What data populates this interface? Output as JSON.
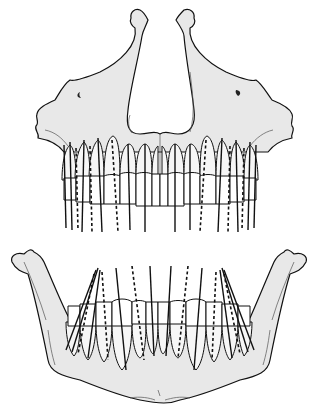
{
  "figure": {
    "type": "anatomical line drawing",
    "panels": [
      {
        "id": "maxilla",
        "label": "Upper jaw (maxilla) with upper dentition",
        "tooth_count": 16
      },
      {
        "id": "mandible",
        "label": "Lower jaw (mandible) with lower dentition",
        "tooth_count": 16
      }
    ],
    "line_styles": {
      "solid": "tooth long axis (visible)",
      "dashed": "tooth long axis (posterior/overlapped)"
    },
    "colors": {
      "bone_fill": "#e8e8e8",
      "outline": "#111111",
      "background": "#ffffff"
    }
  }
}
